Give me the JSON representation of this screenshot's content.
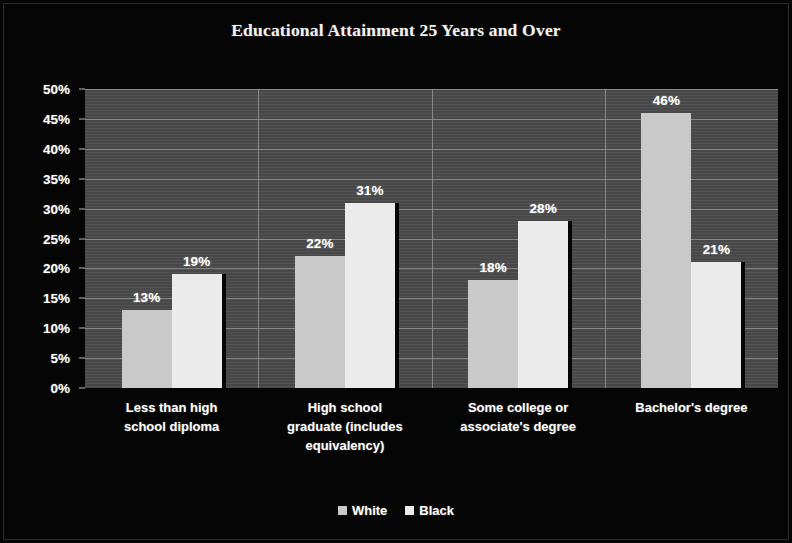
{
  "chart_data": {
    "type": "bar",
    "title": "Educational Attainment 25 Years and Over",
    "xlabel": "",
    "ylabel": "",
    "ylim": [
      0,
      50
    ],
    "ytick_labels": [
      "50%",
      "45%",
      "40%",
      "35%",
      "30%",
      "25%",
      "20%",
      "15%",
      "10%",
      "5%",
      "0%"
    ],
    "ytick_values": [
      50,
      45,
      40,
      35,
      30,
      25,
      20,
      15,
      10,
      5,
      0
    ],
    "grid": "horizontal-and-category-separators",
    "legend_position": "bottom-center",
    "value_label_suffix": "%",
    "categories": [
      "Less than high school diploma",
      "High school graduate (includes equivalency)",
      "Some college or associate's degree",
      "Bachelor's degree"
    ],
    "category_lines": [
      [
        "Less than high",
        "school diploma"
      ],
      [
        "High school",
        "graduate (includes",
        "equivalency)"
      ],
      [
        "Some college or",
        "associate's degree"
      ],
      [
        "Bachelor's degree"
      ]
    ],
    "series": [
      {
        "name": "White",
        "color": "#c9c9c9",
        "values": [
          13,
          22,
          18,
          46
        ],
        "value_labels": [
          "13%",
          "22%",
          "18%",
          "46%"
        ]
      },
      {
        "name": "Black",
        "color": "#ebebeb",
        "values": [
          19,
          31,
          28,
          21
        ],
        "value_labels": [
          "19%",
          "31%",
          "28%",
          "21%"
        ]
      }
    ]
  },
  "colors": {
    "page_background": "#050505",
    "plot_background": "#4b4b4b",
    "gridline": "#9a9a9a",
    "text": "#ffffff",
    "title_text": "#f2f2f2"
  }
}
